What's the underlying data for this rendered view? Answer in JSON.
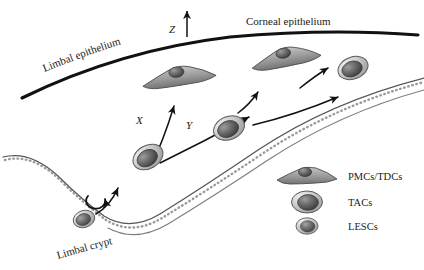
{
  "figure": {
    "background_color": "#ffffff",
    "line_color": "#111111",
    "basement_membrane_color": "#8e8e8e"
  },
  "surfaces": {
    "limbal_epithelium_label": "Limbal epithelium",
    "corneal_epithelium_label": "Corneal epithelium",
    "limbal_crypt_label": "Limbal crypt"
  },
  "axes": [
    {
      "name": "axis-z",
      "label": "Z",
      "description": "vertical upward arrow above corneal surface"
    },
    {
      "name": "axis-x",
      "label": "X",
      "description": "curved arrow for vertical differentiation migration"
    },
    {
      "name": "axis-y",
      "label": "Y",
      "description": "curved arrow for centripetal migration"
    }
  ],
  "legend": {
    "items": [
      {
        "label": "PMCs/TDCs",
        "shape": "flat-spread-cell",
        "fill": "#9a9a9a"
      },
      {
        "label": "TACs",
        "shape": "large-oval-cell",
        "fill": "#b5b5b5"
      },
      {
        "label": "LESCs",
        "shape": "small-oval-cell",
        "fill": "#a8a8a8"
      }
    ]
  },
  "cells": [
    {
      "type": "LESCs",
      "position": "limbal-crypt-base",
      "name": "cell-lesc-crypt"
    },
    {
      "type": "TACs",
      "position": "limbal-basal-lower",
      "name": "cell-tac-lower"
    },
    {
      "type": "TACs",
      "position": "limbal-basal-mid",
      "name": "cell-tac-mid"
    },
    {
      "type": "TACs",
      "position": "corneal-basal-right",
      "name": "cell-tac-right"
    },
    {
      "type": "PMCs/TDCs",
      "position": "corneal-suprabasal-left",
      "name": "cell-pmc-left"
    },
    {
      "type": "PMCs/TDCs",
      "position": "corneal-suprabasal-right",
      "name": "cell-pmc-right"
    }
  ],
  "arrows": [
    {
      "name": "arrow-self-renewal",
      "description": "circular self-renewal arrow at crypt base"
    },
    {
      "name": "arrow-crypt-exit",
      "description": "curved arrow from crypt toward limbal basal layer"
    },
    {
      "name": "arrow-x-differentiation",
      "description": "X upward differentiation arrow"
    },
    {
      "name": "arrow-y-centripetal",
      "description": "Y centripetal migration arrow"
    },
    {
      "name": "arrow-pmc-ascend-left",
      "description": "short arrow to suprabasal PMC"
    },
    {
      "name": "arrow-pmc-ascend-right",
      "description": "short arrow to right suprabasal PMC"
    },
    {
      "name": "arrow-basal-centripetal",
      "description": "horizontal arrow along basal layer to right"
    }
  ]
}
